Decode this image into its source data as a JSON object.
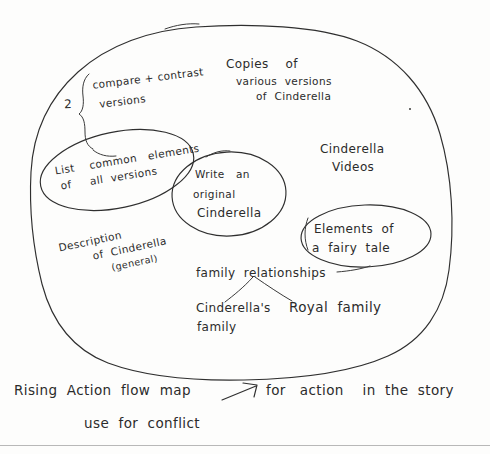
{
  "document": {
    "kind": "hand-drawn-mind-map",
    "subject": "Cinderella unit planning web",
    "ink_color": "#2f2f2f",
    "paper_color": "#fdfdfc"
  },
  "outer_blob": {
    "label": "main-idea-cloud"
  },
  "nodes": {
    "compare_contrast": {
      "counter": "2",
      "line1": "compare + contrast",
      "line2": "versions"
    },
    "copies": {
      "line1": "Copies    of",
      "line2": "various  versions",
      "line3": "of  Cinderella"
    },
    "list_common": {
      "line1": "List    common   elements",
      "line2": "of     all  versions"
    },
    "write_original": {
      "line1": "Write   an",
      "line2": "original",
      "line3": "Cinderella"
    },
    "cinderella_videos": {
      "line1": "Cinderella",
      "line2": "Videos"
    },
    "elements_fairy_tale": {
      "line1": "Elements  of",
      "line2": "a  fairy  tale"
    },
    "description": {
      "line1": "Description",
      "line2": "of  Cinderella",
      "line3": "(general)"
    },
    "family_relationships": {
      "title": "family  relationships",
      "branch_left_line1": "Cinderella's",
      "branch_left_line2": "family",
      "branch_right": "Royal  family"
    }
  },
  "footer": {
    "line1_a": "Rising  Action  flow  map",
    "arrow": "arrow-up-right",
    "line1_b": "for   action    in  the  story",
    "line2": "use  for  conflict"
  }
}
